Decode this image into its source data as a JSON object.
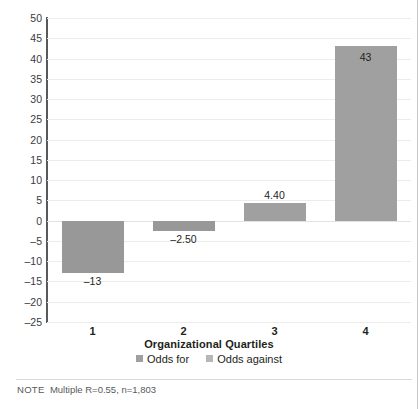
{
  "chart_data": {
    "type": "bar",
    "title": "",
    "xlabel": "Organizational Quartiles",
    "ylabel": "",
    "categories": [
      "1",
      "2",
      "3",
      "4"
    ],
    "values": [
      -13,
      -2.5,
      4.4,
      43
    ],
    "value_labels": [
      "–13",
      "–2.50",
      "4.40",
      "43"
    ],
    "ylim": [
      -25,
      50
    ],
    "ytick_values": [
      50,
      45,
      40,
      35,
      30,
      25,
      20,
      15,
      10,
      5,
      0,
      -5,
      -10,
      -15,
      -20,
      -25
    ],
    "ytick_labels": [
      "50",
      "45",
      "40",
      "35",
      "30",
      "25",
      "20",
      "15",
      "10",
      "5",
      "0",
      "–5",
      "–10",
      "–15",
      "–20",
      "–25"
    ],
    "grid": true,
    "legend": {
      "position": "bottom",
      "entries": [
        {
          "label": "Odds for",
          "color": "#a0a0a0"
        },
        {
          "label": "Odds against",
          "color": "#b7b7b7"
        }
      ]
    },
    "bar_color": "#a0a0a0",
    "negative_bar_color": "#989898"
  },
  "note": {
    "keyword": "NOTE",
    "text": "Multiple R=0.55, n=1,803"
  },
  "colors": {
    "background": "#ffffff",
    "axis": "#58595b",
    "gridline": "#ececec",
    "text": "#231f20",
    "muted_text": "#58595b",
    "bar": "#a0a0a0"
  }
}
